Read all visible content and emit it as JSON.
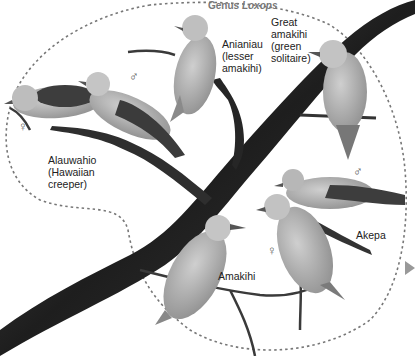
{
  "figure": {
    "genus_label": {
      "prefix": "Genus ",
      "name": "Loxops"
    },
    "colors": {
      "branch": "#2b2b2b",
      "bird_body": "#a8a8a8",
      "bird_dark": "#4a4a4a",
      "dashed_boundary": "#777777",
      "text": "#222222",
      "genus_text": "#777777"
    },
    "species": [
      {
        "id": "alauwahio",
        "label": "Alauwahio\n(Hawaiian\ncreeper)"
      },
      {
        "id": "anianiau",
        "label": "Anianiau\n(lesser\namakihi)"
      },
      {
        "id": "great-amakihi",
        "label": "Great\namakihi\n(green\nsolitaire)"
      },
      {
        "id": "akepa",
        "label": "Akepa"
      },
      {
        "id": "amakihi",
        "label": "Amakihi"
      }
    ],
    "sex_symbols": {
      "male": "♂",
      "female": "♀"
    }
  }
}
